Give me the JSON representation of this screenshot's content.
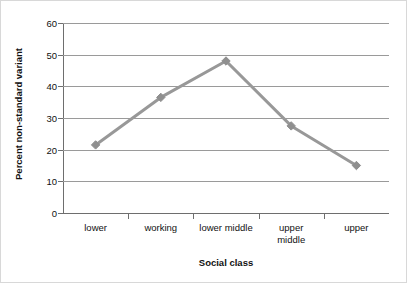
{
  "chart_data": {
    "type": "line",
    "title": "",
    "xlabel": "Social class",
    "ylabel": "Percent non-standard variant",
    "categories": [
      "lower",
      "working",
      "lower middle",
      "upper\nmiddle",
      "upper"
    ],
    "category_labels_flat": [
      "lower",
      "working",
      "lower middle",
      "upper middle",
      "upper"
    ],
    "values": [
      21.5,
      36.5,
      48,
      27.5,
      15
    ],
    "series": [
      {
        "name": "Percent non-standard variant",
        "values": [
          21.5,
          36.5,
          48,
          27.5,
          15
        ]
      }
    ],
    "ylim": [
      0,
      60
    ],
    "yticks": [
      0,
      10,
      20,
      30,
      40,
      50,
      60
    ],
    "ytick_labels": [
      "0",
      "10",
      "20",
      "30",
      "40",
      "50",
      "60"
    ],
    "grid": true,
    "legend": "none",
    "line_color": "#989898",
    "marker_color": "#8f8f8f",
    "gridline_color": "#9a9a9a",
    "axis_color": "#6e6e6e",
    "text_color": "#111111",
    "background": "#ffffff",
    "border_color": "#d8d8d8"
  }
}
